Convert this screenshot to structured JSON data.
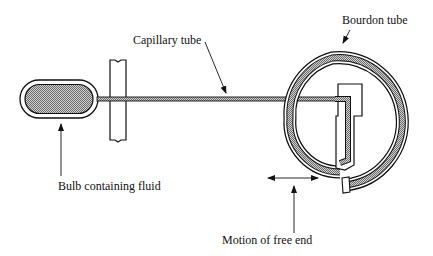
{
  "diagram": {
    "labels": {
      "capillary": "Capillary tube",
      "bourdon": "Bourdon tube",
      "bulb": "Bulb containing fluid",
      "motion": "Motion of free end"
    },
    "colors": {
      "line": "#111111",
      "fill_pattern": "#9a9a9a",
      "background": "#ffffff"
    }
  }
}
